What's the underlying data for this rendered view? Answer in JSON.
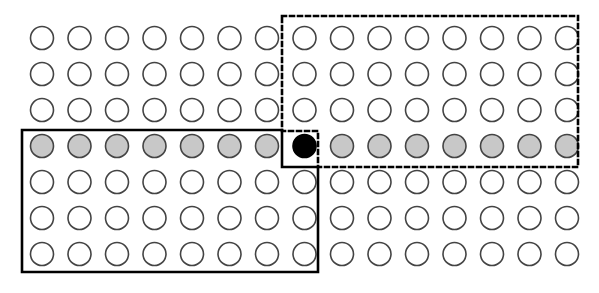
{
  "figure": {
    "canvas": {
      "width": 599,
      "height": 293,
      "background": "#ffffff"
    }
  },
  "chart_data": {
    "type": "scatter",
    "title": "",
    "subtitle": "",
    "xlabel": "",
    "ylabel": "",
    "grid": false,
    "legend_position": "none",
    "lattice": {
      "columns": 15,
      "rows": 7,
      "origin_x": 42,
      "origin_y": 38,
      "col_spacing": 37.5,
      "row_spacing": 36,
      "circle_radius": 11.5,
      "stroke_width": 1.6,
      "stroke_color": "#444444"
    },
    "fill_legend": {
      "empty": {
        "label": "unfilled",
        "color": "#ffffff"
      },
      "gray": {
        "label": "gray-filled",
        "color": "#c8c8c8"
      },
      "black": {
        "label": "black-filled",
        "color": "#000000"
      }
    },
    "row_fills": [
      "empty",
      "empty",
      "empty",
      "mixed",
      "empty",
      "empty",
      "empty"
    ],
    "cells": [
      {
        "row": 1,
        "fills": [
          "empty",
          "empty",
          "empty",
          "empty",
          "empty",
          "empty",
          "empty",
          "empty",
          "empty",
          "empty",
          "empty",
          "empty",
          "empty",
          "empty",
          "empty"
        ]
      },
      {
        "row": 2,
        "fills": [
          "empty",
          "empty",
          "empty",
          "empty",
          "empty",
          "empty",
          "empty",
          "empty",
          "empty",
          "empty",
          "empty",
          "empty",
          "empty",
          "empty",
          "empty"
        ]
      },
      {
        "row": 3,
        "fills": [
          "empty",
          "empty",
          "empty",
          "empty",
          "empty",
          "empty",
          "empty",
          "empty",
          "empty",
          "empty",
          "empty",
          "empty",
          "empty",
          "empty",
          "empty"
        ]
      },
      {
        "row": 4,
        "fills": [
          "gray",
          "gray",
          "gray",
          "gray",
          "gray",
          "gray",
          "gray",
          "black",
          "gray",
          "gray",
          "gray",
          "gray",
          "gray",
          "gray",
          "gray"
        ]
      },
      {
        "row": 5,
        "fills": [
          "empty",
          "empty",
          "empty",
          "empty",
          "empty",
          "empty",
          "empty",
          "empty",
          "empty",
          "empty",
          "empty",
          "empty",
          "empty",
          "empty",
          "empty"
        ]
      },
      {
        "row": 6,
        "fills": [
          "empty",
          "empty",
          "empty",
          "empty",
          "empty",
          "empty",
          "empty",
          "empty",
          "empty",
          "empty",
          "empty",
          "empty",
          "empty",
          "empty",
          "empty"
        ]
      },
      {
        "row": 7,
        "fills": [
          "empty",
          "empty",
          "empty",
          "empty",
          "empty",
          "empty",
          "empty",
          "empty",
          "empty",
          "empty",
          "empty",
          "empty",
          "empty",
          "empty",
          "empty"
        ]
      }
    ],
    "highlight_cell": {
      "row": 4,
      "column": 8,
      "fill": "black"
    },
    "regions": [
      {
        "name": "solid-region",
        "style": "solid",
        "stroke_color": "#000000",
        "stroke_width": 2.6,
        "covers_description": "row 4 columns 1-7, plus rows 5-7 columns 1-8",
        "path": "M 22,130 L 282,130 L 282,167 L 318,167 L 318,272 L 22,272 Z"
      },
      {
        "name": "dashed-region",
        "style": "dashed",
        "stroke_color": "#000000",
        "stroke_width": 2.6,
        "dash_pattern": "4 4",
        "covers_description": "rows 1-3 columns 8-15, plus row 4 columns 9-15",
        "path": "M 282,16 L 578,16 L 578,167 L 318,167 L 318,131 L 282,131 Z"
      }
    ]
  }
}
